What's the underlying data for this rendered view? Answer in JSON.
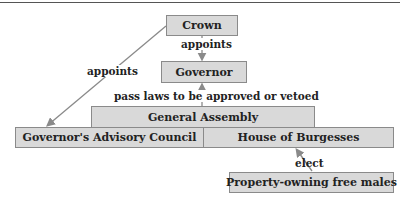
{
  "diagram": {
    "nodes": {
      "crown": "Crown",
      "governor": "Governor",
      "general_assembly": "General Assembly",
      "advisory_council": "Governor's Advisory Council",
      "house_of_burgesses": "House of Burgesses",
      "voters": "Property-owning free males"
    },
    "edges": {
      "crown_to_governor": "appoints",
      "crown_to_council": "appoints",
      "assembly_to_governor": "pass laws to be approved or vetoed",
      "voters_to_house": "elect"
    },
    "colors": {
      "box_fill": "#d9d9d9",
      "box_border": "#8a8a8a",
      "arrow": "#8a8a8a",
      "text": "#222222"
    }
  }
}
